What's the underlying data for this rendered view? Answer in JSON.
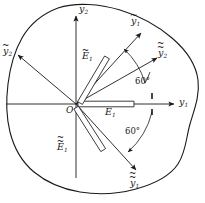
{
  "figure": {
    "type": "technical-diagram",
    "background_color": "#ffffff",
    "line_color": "#1a1a1a",
    "origin": {
      "label": "O",
      "x": 76,
      "y": 104
    },
    "boundary": {
      "name": "irregular-body-outline",
      "description": "closed irregular blob enclosing the axes and cracks"
    },
    "axes": [
      {
        "id": "y1",
        "label_base": "y",
        "label_sub": "1",
        "accent": "none",
        "direction_deg": 0,
        "tip_x": 176,
        "tip_y": 104,
        "label_x": 180,
        "label_y": 99
      },
      {
        "id": "y2",
        "label_base": "y",
        "label_sub": "2",
        "accent": "none",
        "direction_deg": 90,
        "tip_x": 76,
        "tip_y": 14,
        "label_x": 81,
        "label_y": 6
      },
      {
        "id": "y1-tilde",
        "label_base": "y",
        "label_sub": "1",
        "accent": "tilde",
        "direction_deg": 60,
        "tip_x": 143,
        "tip_y": 31,
        "label_x": 133,
        "label_y": 18
      },
      {
        "id": "y2-tilde",
        "label_base": "y",
        "label_sub": "2",
        "accent": "tilde",
        "direction_deg": 150,
        "tip_x": 16,
        "tip_y": 54,
        "label_x": 4,
        "label_y": 48
      },
      {
        "id": "y1-double-tilde",
        "label_base": "y",
        "label_sub": "1",
        "accent": "double-tilde",
        "direction_deg": -60,
        "tip_x": 138,
        "tip_y": 172,
        "label_x": 131,
        "label_y": 180
      },
      {
        "id": "y2-double-tilde",
        "label_base": "y",
        "label_sub": "2",
        "accent": "double-tilde",
        "direction_deg": 30,
        "tip_x": 159,
        "tip_y": 56,
        "label_x": 160,
        "label_y": 50
      }
    ],
    "cracks": [
      {
        "id": "E1",
        "label_base": "E",
        "label_sub": "1",
        "accent": "none",
        "angle_deg": 0,
        "label_x": 106,
        "label_y": 108,
        "description": "horizontal slit along y1 axis"
      },
      {
        "id": "E1-tilde",
        "label_base": "E",
        "label_sub": "1",
        "accent": "tilde",
        "angle_deg": 60,
        "label_x": 83,
        "label_y": 53,
        "description": "slit inclined at 60 degrees"
      },
      {
        "id": "E1-double-tilde",
        "label_base": "E",
        "label_sub": "1",
        "accent": "double-tilde",
        "angle_deg": -60,
        "label_x": 58,
        "label_y": 143,
        "description": "slit inclined at minus 60 degrees"
      }
    ],
    "angles": [
      {
        "id": "angle-upper",
        "text": "60°",
        "label_x": 137,
        "label_y": 81,
        "from_deg": 30,
        "to_deg": 60,
        "description": "arc from y1 axis region up to y1-tilde"
      },
      {
        "id": "angle-lower",
        "text": "60°",
        "label_x": 127,
        "label_y": 131,
        "from_deg": 0,
        "to_deg": -60,
        "description": "arc from y1 axis down to y1-double-tilde"
      }
    ],
    "tick_marks": [
      {
        "id": "tick-upper",
        "x": 152,
        "y": 96
      },
      {
        "id": "tick-lower",
        "x": 152,
        "y": 110
      }
    ]
  }
}
